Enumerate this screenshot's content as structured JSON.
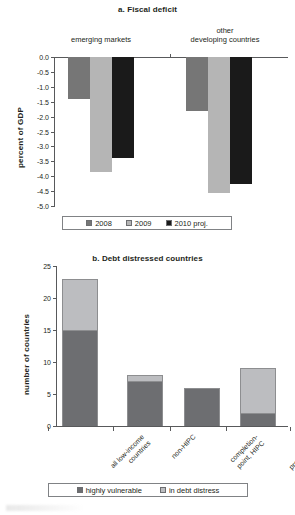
{
  "chart_data": [
    {
      "type": "bar",
      "title": "a. Fiscal deficit",
      "ylabel": "percent of GDP",
      "xlabel": "",
      "ylim": [
        -5.0,
        0.0
      ],
      "yticks": [
        "0.0",
        "-0.5",
        "-1.0",
        "-1.5",
        "-2.0",
        "-2.5",
        "-3.0",
        "-3.5",
        "-4.0",
        "-4.5",
        "-5.0"
      ],
      "ytick_values": [
        0.0,
        -0.5,
        -1.0,
        -1.5,
        -2.0,
        -2.5,
        -3.0,
        -3.5,
        -4.0,
        -4.5,
        -5.0
      ],
      "grid": false,
      "legend_position": "bottom",
      "categories": [
        "emerging markets",
        "other developing countries"
      ],
      "category_lines": [
        [
          "emerging markets"
        ],
        [
          "other",
          "developing countries"
        ]
      ],
      "series": [
        {
          "name": "2008",
          "color": "#767676",
          "values": [
            -1.4,
            -1.8
          ]
        },
        {
          "name": "2009",
          "color": "#b5b5b5",
          "values": [
            -3.85,
            -4.55
          ]
        },
        {
          "name": "2010 proj.",
          "color": "#1a1a1a",
          "values": [
            -3.4,
            -4.25
          ]
        }
      ]
    },
    {
      "type": "bar",
      "subtype": "stacked",
      "title": "b. Debt distressed countries",
      "ylabel": "number of countries",
      "xlabel": "",
      "ylim": [
        0,
        25
      ],
      "yticks": [
        "25",
        "20",
        "15",
        "10",
        "5",
        "0"
      ],
      "ytick_values": [
        25,
        20,
        15,
        10,
        5,
        0
      ],
      "grid": false,
      "legend_position": "bottom",
      "categories": [
        "all low-income countries",
        "non-HIPC",
        "completion-point, HIPC",
        "precompletion-point, HIPC"
      ],
      "category_lines": [
        [
          "all low-income",
          "countries"
        ],
        [
          "non-HIPC"
        ],
        [
          "completion-",
          "point, HIPC"
        ],
        [
          "precompletion-",
          "point, HIPC"
        ]
      ],
      "series": [
        {
          "name": "highly vulnerable",
          "color": "#6d6e71",
          "values": [
            15,
            7,
            6,
            2
          ]
        },
        {
          "name": "in debt distress",
          "color": "#bcbdc0",
          "values": [
            8,
            1,
            0,
            7
          ]
        }
      ],
      "totals": [
        23,
        8,
        6,
        9
      ]
    }
  ],
  "colors": {
    "axis": "#58595b",
    "text": "#231f20",
    "series_2008": "#767676",
    "series_2009": "#b5b5b5",
    "series_2010": "#1a1a1a",
    "highly_vulnerable": "#6d6e71",
    "in_debt_distress": "#bcbdc0",
    "background": "#ffffff"
  }
}
